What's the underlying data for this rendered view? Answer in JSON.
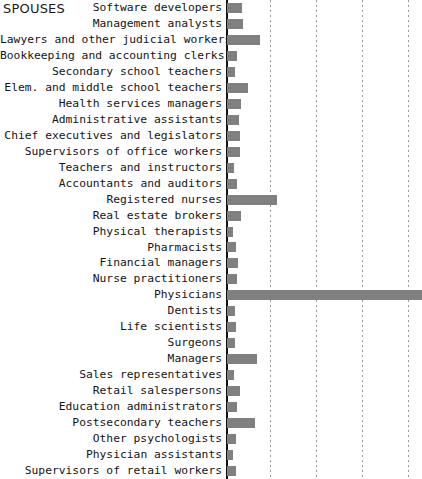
{
  "chart": {
    "title": "SPOUSES",
    "type": "bar",
    "orientation": "horizontal",
    "bar_color": "#808080",
    "axis_color": "#111111",
    "grid": true,
    "grid_style": "dotted-vertical",
    "legend": "none",
    "xlabel": "",
    "ylabel": "",
    "axis_origin_x": 226,
    "plot_right_x": 421,
    "xlim": [
      0,
      4.2
    ],
    "gridline_values": [
      1,
      2,
      3,
      4
    ],
    "gridline_positions_px": [
      270,
      316,
      362,
      408
    ]
  },
  "chart_data": {
    "type": "bar",
    "title": "SPOUSES",
    "xlabel": "",
    "ylabel": "",
    "orientation": "horizontal",
    "grid": true,
    "legend_position": "none",
    "xlim": [
      0,
      4.2
    ],
    "categories": [
      "Software developers",
      "Management analysts",
      "Lawyers and other judicial workers",
      "Bookkeeping and accounting clerks",
      "Secondary school teachers",
      "Elem. and middle school teachers",
      "Health services managers",
      "Administrative assistants",
      "Chief executives and legislators",
      "Supervisors of office workers",
      "Teachers and instructors",
      "Accountants and auditors",
      "Registered nurses",
      "Real estate brokers",
      "Physical therapists",
      "Pharmacists",
      "Financial managers",
      "Nurse practitioners",
      "Physicians",
      "Dentists",
      "Life scientists",
      "Surgeons",
      "Managers",
      "Sales representatives",
      "Retail salespersons",
      "Education administrators",
      "Postsecondary teachers",
      "Other psychologists",
      "Physician assistants",
      "Supervisors of retail workers"
    ],
    "values": [
      0.32,
      0.35,
      0.72,
      0.22,
      0.17,
      0.46,
      0.3,
      0.26,
      0.28,
      0.27,
      0.14,
      0.22,
      1.08,
      0.3,
      0.13,
      0.2,
      0.24,
      0.21,
      4.2,
      0.17,
      0.2,
      0.17,
      0.64,
      0.15,
      0.28,
      0.22,
      0.6,
      0.19,
      0.12,
      0.2
    ]
  }
}
